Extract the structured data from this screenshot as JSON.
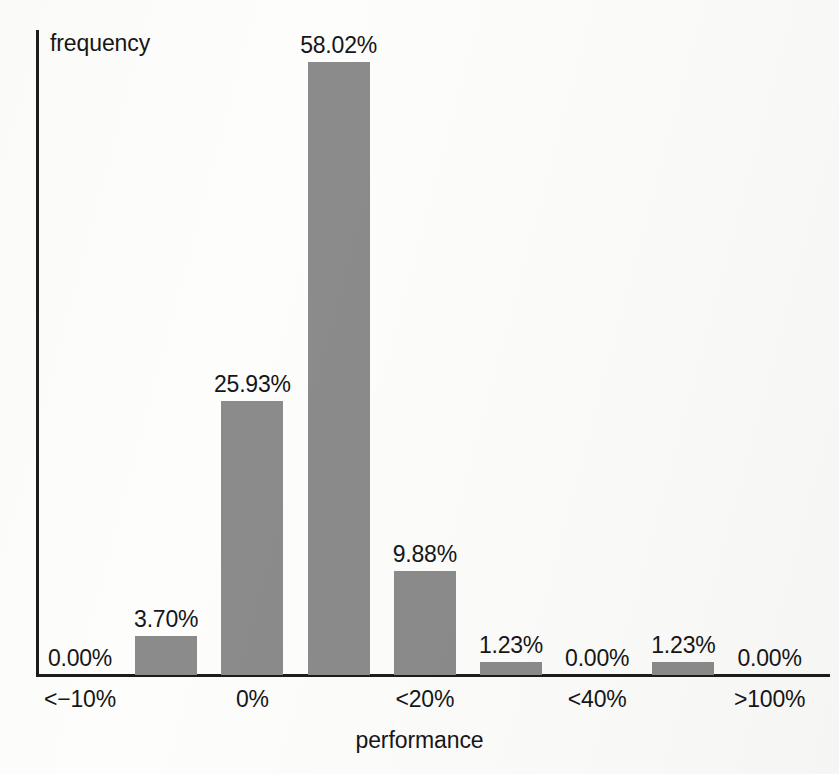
{
  "chart_data": {
    "type": "bar",
    "title": "",
    "xlabel": "performance",
    "ylabel": "frequency",
    "categories": [
      "<-10%",
      "-10%",
      "0%",
      "<10%",
      "<20%",
      "<30%",
      "<40%",
      "<100%",
      ">100%"
    ],
    "values": [
      0.0,
      3.7,
      25.93,
      58.02,
      9.88,
      1.23,
      0.0,
      1.23,
      0.0
    ],
    "value_labels": [
      "0.00%",
      "3.70%",
      "25.93%",
      "58.02%",
      "9.88%",
      "1.23%",
      "0.00%",
      "1.23%",
      "0.00%"
    ],
    "tick_labels": [
      "<−10%",
      "0%",
      "<20%",
      "<40%",
      ">100%"
    ],
    "tick_indices": [
      0,
      2,
      4,
      6,
      8
    ],
    "ylim": [
      0,
      58.02
    ],
    "grid": false,
    "legend": "none",
    "bar_color": "#8b8b8b",
    "text_color": "#161616",
    "axis_color": "#1c1c1c",
    "background_color": "#fdfdfc"
  },
  "axis_titles": {
    "y": "frequency",
    "x": "performance"
  }
}
